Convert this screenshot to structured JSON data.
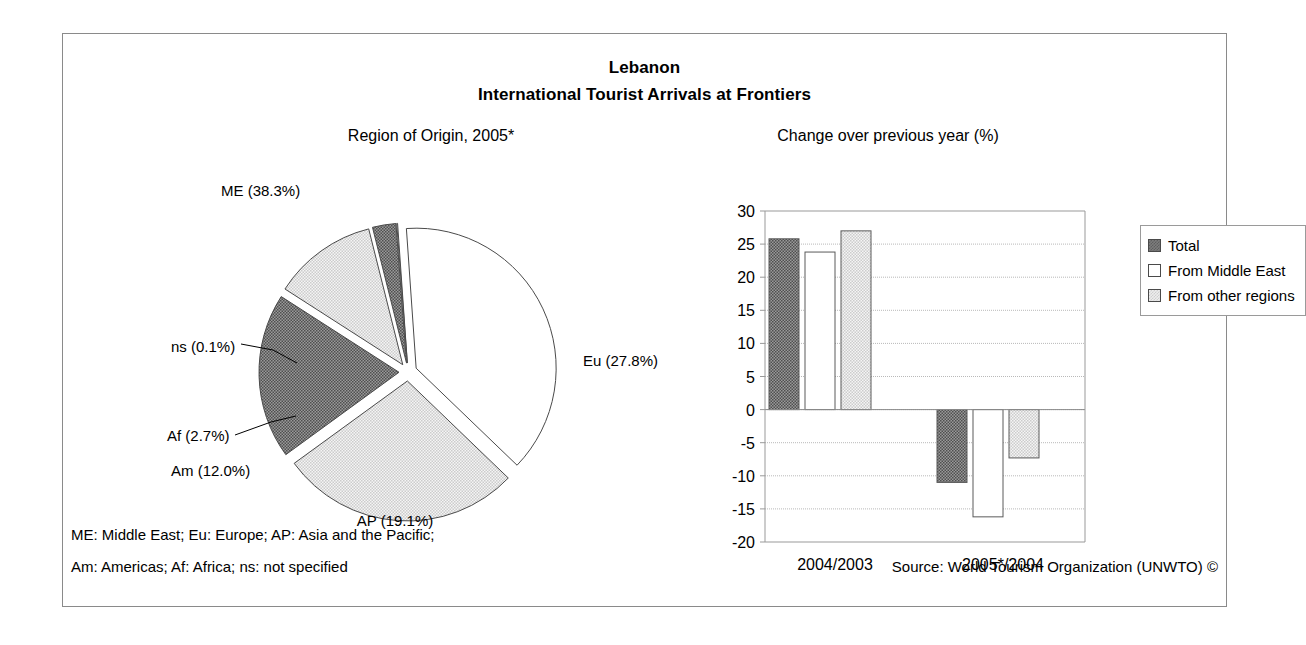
{
  "chart_title": {
    "line1": "Lebanon",
    "line2": "International Tourist Arrivals at Frontiers"
  },
  "pie_panel": {
    "title": "Region of Origin, 2005*"
  },
  "bar_panel": {
    "title": "Change over previous year (%)"
  },
  "legend": {
    "items": [
      {
        "label": "Total",
        "swatch": "dark"
      },
      {
        "label": "From Middle East",
        "swatch": "white"
      },
      {
        "label": "From other regions",
        "swatch": "light"
      }
    ]
  },
  "footnotes": {
    "line1": "ME: Middle East; Eu: Europe; AP: Asia and the Pacific;",
    "line2": "Am: Americas; Af: Africa; ns: not specified",
    "source": "Source: World Tourism Organization (UNWTO) ©"
  },
  "colors": {
    "dark": "#7d7d7d",
    "light": "#ededed",
    "white": "#ffffff",
    "outline": "#5a5a5a",
    "grid": "#b9b9b9",
    "frame": "#8a8a8a"
  },
  "chart_data": [
    {
      "type": "pie",
      "title": "Region of Origin, 2005*",
      "categories": [
        "ME",
        "Eu",
        "AP",
        "Am",
        "Af",
        "ns"
      ],
      "labels": [
        "ME (38.3%)",
        "Eu (27.8%)",
        "AP (19.1%)",
        "Am (12.0%)",
        "Af (2.7%)",
        "ns (0.1%)"
      ],
      "values": [
        38.3,
        27.8,
        19.1,
        12.0,
        2.7,
        0.1
      ],
      "unit": "%",
      "exploded": true,
      "slice_fills": [
        "white",
        "light",
        "dark",
        "light",
        "dark",
        "white"
      ],
      "legend": "none"
    },
    {
      "type": "bar",
      "title": "Change over previous year (%)",
      "categories": [
        "2004/2003",
        "2005*/2004"
      ],
      "series": [
        {
          "name": "Total",
          "values": [
            25.8,
            -11.0
          ],
          "fill": "dark"
        },
        {
          "name": "From Middle East",
          "values": [
            23.8,
            -16.2
          ],
          "fill": "white"
        },
        {
          "name": "From other regions",
          "values": [
            27.0,
            -7.3
          ],
          "fill": "light"
        }
      ],
      "xlabel": "",
      "ylabel": "",
      "ylim": [
        -20,
        30
      ],
      "yticks": [
        30,
        25,
        20,
        15,
        10,
        5,
        0,
        -5,
        -10,
        -15,
        -20
      ],
      "ytick_labels": [
        "30",
        "25",
        "20",
        "15",
        "10",
        "5",
        "0",
        "-5",
        "-10",
        "-15",
        "-20"
      ],
      "grid": true,
      "legend_position": "right"
    }
  ]
}
